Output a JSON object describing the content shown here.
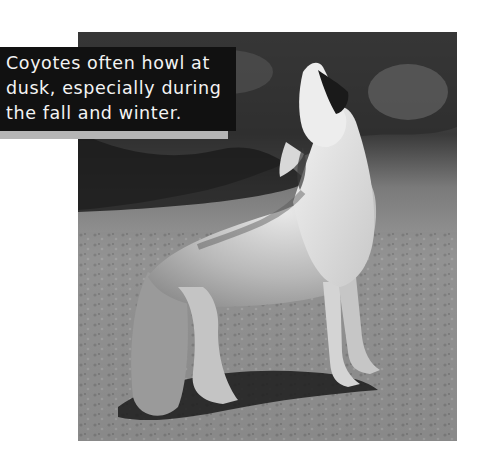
{
  "page": {
    "type": "book-page",
    "colors": {
      "background": "#ffffff",
      "caption_box": "#111111",
      "caption_text": "#f4f4f4",
      "caption_strip": "#b5b5b5"
    }
  },
  "caption": {
    "lines": [
      "Coyotes often howl at",
      "dusk, especially during",
      "the fall and winter."
    ],
    "text": "Coyotes often howl at\ndusk, especially during\nthe fall and winter."
  },
  "photo": {
    "subject": "coyote howling",
    "description": "Grayscale photograph of a coyote standing on rocky ground, head raised, howling, with dark foliage in the background",
    "style": "grayscale"
  }
}
